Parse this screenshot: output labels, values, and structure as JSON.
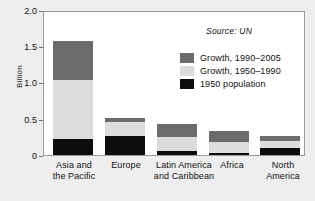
{
  "figure": {
    "clipped_top_text": "",
    "source_note": "Source: UN",
    "background_color": "#eeeeee",
    "plot_background_color": "#ffffff"
  },
  "chart_data": {
    "type": "bar",
    "stacked": true,
    "title": "",
    "subtitle": "",
    "xlabel": "",
    "ylabel": "Billion",
    "ylim": [
      0,
      2.0
    ],
    "yticks": [
      "0",
      "0.5",
      "1.0",
      "1.5",
      "2.0"
    ],
    "ytick_values": [
      0,
      0.5,
      1.0,
      1.5,
      2.0
    ],
    "grid": false,
    "legend_position": "upper-center",
    "categories": [
      "Asia and\nthe Pacific",
      "Europe",
      "Latin America\nand Caribbean",
      "Africa",
      "North\nAmerica"
    ],
    "category_lines": [
      [
        "Asia and",
        "the Pacific"
      ],
      [
        "Europe",
        ""
      ],
      [
        "Latin America",
        "and Caribbean"
      ],
      [
        "Africa",
        ""
      ],
      [
        "North",
        "America"
      ]
    ],
    "series": [
      {
        "name": "1950 population",
        "color": "#0d0d0d",
        "values": [
          0.22,
          0.26,
          0.06,
          0.03,
          0.1
        ]
      },
      {
        "name": "Growth, 1950–1990",
        "color": "#dcdcdc",
        "values": [
          0.83,
          0.2,
          0.19,
          0.15,
          0.09
        ]
      },
      {
        "name": "Growth, 1990–2005",
        "color": "#6b6b6b",
        "values": [
          0.55,
          0.06,
          0.18,
          0.15,
          0.07
        ]
      }
    ],
    "totals": [
      1.6,
      0.52,
      0.43,
      0.33,
      0.26
    ],
    "legend_entries": [
      {
        "label": "Growth, 1990–2005",
        "color": "#6b6b6b"
      },
      {
        "label": "Growth, 1950–1990",
        "color": "#dcdcdc"
      },
      {
        "label": "1950 population",
        "color": "#0d0d0d"
      }
    ]
  }
}
